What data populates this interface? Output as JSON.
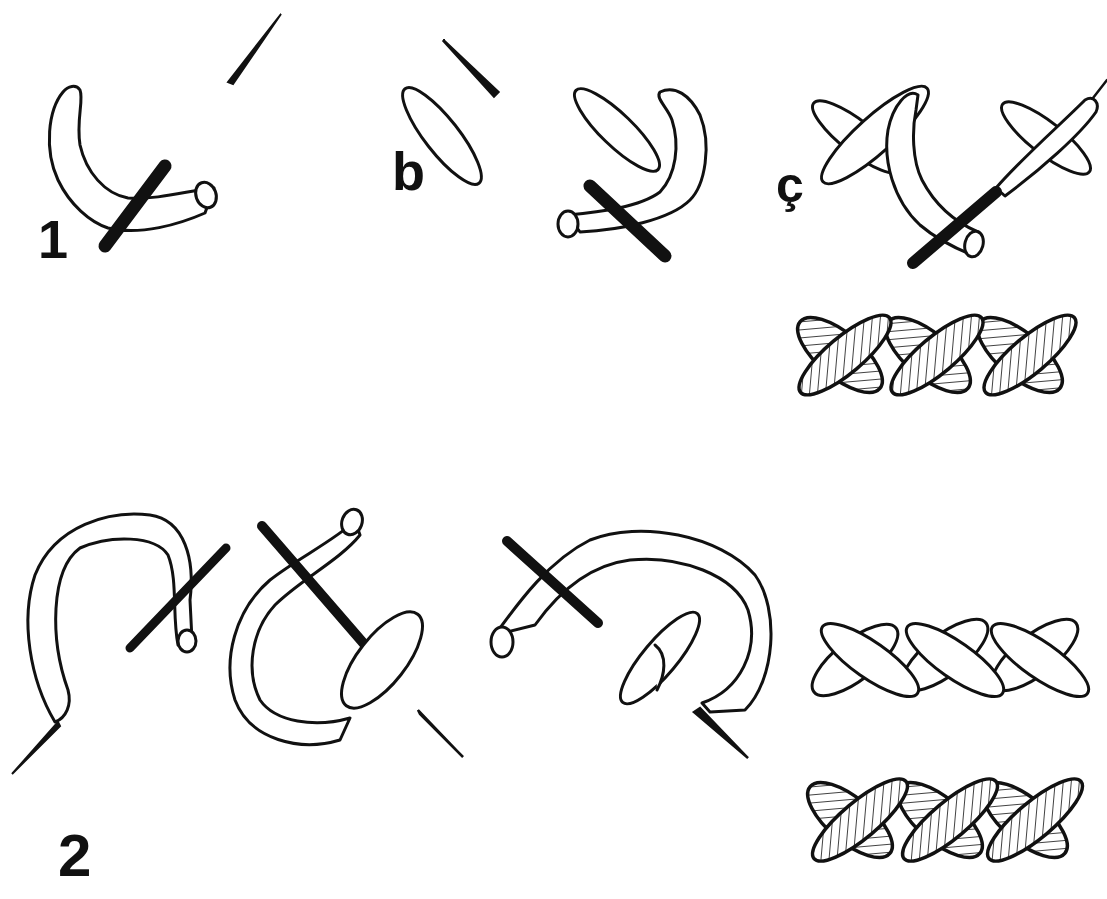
{
  "figure": {
    "labels": {
      "step1": "1",
      "step_b": "b",
      "step_c": "ç",
      "step2": "2"
    },
    "colors": {
      "ink": "#111111",
      "background": "#ffffff"
    },
    "panels": [
      {
        "id": "1",
        "description": "needle passing under curved thread, single stitch"
      },
      {
        "id": "b",
        "description": "first diagonal stitch and second stitch being formed"
      },
      {
        "id": "ç",
        "description": "crossed stitches with needle, completed hatched braid row"
      },
      {
        "id": "2",
        "description": "looped thread variation with needle, plain and hatched braid rows"
      }
    ]
  }
}
